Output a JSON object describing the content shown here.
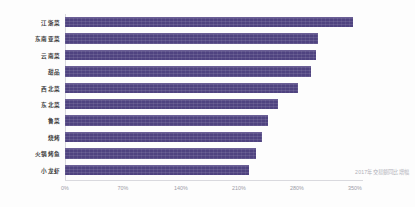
{
  "chart_data": {
    "type": "bar",
    "orientation": "horizontal",
    "title": "",
    "xlabel": "",
    "ylabel": "",
    "categories": [
      "江浙菜",
      "东南亚菜",
      "云南菜",
      "甜品",
      "西北菜",
      "东北菜",
      "鲁菜",
      "烧烤",
      "火锅烤鱼",
      "小龙虾"
    ],
    "values": [
      347,
      305,
      303,
      297,
      281,
      257,
      245,
      238,
      230,
      222
    ],
    "value_unit": "%",
    "xlim": [
      0,
      350
    ],
    "xticks": [
      0,
      70,
      140,
      210,
      280,
      350
    ],
    "xtick_labels": [
      "0%",
      "70%",
      "140%",
      "210%",
      "280%",
      "350%"
    ],
    "grid": false,
    "legend": null,
    "series": [
      {
        "name": "2017年交易额同比增幅",
        "values": [
          347,
          305,
          303,
          297,
          281,
          257,
          245,
          238,
          230,
          222
        ]
      }
    ],
    "annotations": [
      "2017年交易额同比增幅"
    ]
  },
  "caption": "2017年交易额同比增幅",
  "colors": {
    "bar": "#4f4380",
    "bar_highlight": "#6b5f96",
    "axis": "#d9d9de",
    "tick_text": "#9b9ba6",
    "category_text": "#3a3a3a",
    "caption_text": "#b0b0b8",
    "background": "#fdfdfd"
  }
}
